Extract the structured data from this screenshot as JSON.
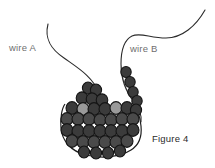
{
  "figure": {
    "caption": "Figure 4",
    "background_color": "#ffffff",
    "labels": {
      "wire_a": "wire A",
      "wire_b": "wire B"
    },
    "label_color": "#6f6f6f",
    "caption_color": "#2a2a2a",
    "line_color": "#2b2b2b",
    "bead_colors": {
      "dark": "#3b3b3b",
      "mid": "#4a4a4a",
      "light": "#9a9a9a",
      "outline": "#151515"
    },
    "wires": [
      {
        "name": "wire A",
        "path": "M 48 24 C 44 40, 52 50, 64 58 C 78 68, 92 76, 100 94 C 104 104, 104 112, 103 118"
      },
      {
        "name": "wire B",
        "path": "M 205 10 C 196 26, 182 38, 166 38 C 150 38, 140 32, 132 36 C 124 40, 121 52, 121 64 C 121 78, 126 92, 134 102 C 139 108, 142 114, 141 122"
      }
    ],
    "pouch_outline": "M 65 104 C 62 108, 60 118, 61 128 C 62 140, 70 151, 86 155 C 102 159, 120 157, 131 150 C 139 145, 142 136, 141 126 C 140 116, 137 108, 133 103",
    "bead_strand_b": [
      {
        "cx": 126,
        "cy": 72,
        "r": 5.2,
        "tone": "dark"
      },
      {
        "cx": 130,
        "cy": 82,
        "r": 5.2,
        "tone": "dark"
      },
      {
        "cx": 133,
        "cy": 92,
        "r": 5.2,
        "tone": "dark"
      },
      {
        "cx": 137,
        "cy": 101,
        "r": 5.2,
        "tone": "dark"
      }
    ],
    "bead_rows": [
      {
        "row": 1,
        "beads": [
          {
            "cx": 88,
            "cy": 88,
            "r": 5.6,
            "tone": "dark"
          },
          {
            "cx": 96,
            "cy": 90,
            "r": 5.6,
            "tone": "dark"
          }
        ]
      },
      {
        "row": 2,
        "beads": [
          {
            "cx": 82,
            "cy": 98,
            "r": 5.8,
            "tone": "dark"
          },
          {
            "cx": 92,
            "cy": 99,
            "r": 5.8,
            "tone": "dark"
          },
          {
            "cx": 102,
            "cy": 100,
            "r": 5.8,
            "tone": "dark"
          }
        ]
      },
      {
        "row": 3,
        "beads": [
          {
            "cx": 72,
            "cy": 108,
            "r": 6.0,
            "tone": "dark"
          },
          {
            "cx": 83,
            "cy": 109,
            "r": 6.0,
            "tone": "light"
          },
          {
            "cx": 94,
            "cy": 109,
            "r": 6.0,
            "tone": "dark"
          },
          {
            "cx": 105,
            "cy": 109,
            "r": 6.0,
            "tone": "dark"
          },
          {
            "cx": 116,
            "cy": 108,
            "r": 6.0,
            "tone": "light"
          },
          {
            "cx": 127,
            "cy": 108,
            "r": 6.0,
            "tone": "dark"
          },
          {
            "cx": 136,
            "cy": 110,
            "r": 5.6,
            "tone": "dark"
          }
        ]
      },
      {
        "row": 4,
        "beads": [
          {
            "cx": 67,
            "cy": 119,
            "r": 6.0,
            "tone": "mid"
          },
          {
            "cx": 78,
            "cy": 119,
            "r": 6.0,
            "tone": "mid"
          },
          {
            "cx": 89,
            "cy": 119,
            "r": 6.0,
            "tone": "mid"
          },
          {
            "cx": 100,
            "cy": 120,
            "r": 6.0,
            "tone": "mid"
          },
          {
            "cx": 111,
            "cy": 120,
            "r": 6.0,
            "tone": "mid"
          },
          {
            "cx": 122,
            "cy": 119,
            "r": 6.0,
            "tone": "mid"
          },
          {
            "cx": 133,
            "cy": 119,
            "r": 6.0,
            "tone": "mid"
          }
        ]
      },
      {
        "row": 5,
        "beads": [
          {
            "cx": 67,
            "cy": 130,
            "r": 6.0,
            "tone": "dark"
          },
          {
            "cx": 78,
            "cy": 131,
            "r": 6.0,
            "tone": "dark"
          },
          {
            "cx": 89,
            "cy": 131,
            "r": 6.0,
            "tone": "dark"
          },
          {
            "cx": 100,
            "cy": 131,
            "r": 6.0,
            "tone": "dark"
          },
          {
            "cx": 111,
            "cy": 131,
            "r": 6.0,
            "tone": "dark"
          },
          {
            "cx": 122,
            "cy": 131,
            "r": 6.0,
            "tone": "dark"
          },
          {
            "cx": 133,
            "cy": 130,
            "r": 6.0,
            "tone": "dark"
          }
        ]
      },
      {
        "row": 6,
        "beads": [
          {
            "cx": 72,
            "cy": 141,
            "r": 6.0,
            "tone": "mid"
          },
          {
            "cx": 83,
            "cy": 142,
            "r": 6.0,
            "tone": "mid"
          },
          {
            "cx": 94,
            "cy": 142,
            "r": 6.0,
            "tone": "mid"
          },
          {
            "cx": 105,
            "cy": 142,
            "r": 6.0,
            "tone": "mid"
          },
          {
            "cx": 116,
            "cy": 142,
            "r": 6.0,
            "tone": "mid"
          },
          {
            "cx": 127,
            "cy": 141,
            "r": 6.0,
            "tone": "mid"
          }
        ]
      },
      {
        "row": 7,
        "beads": [
          {
            "cx": 84,
            "cy": 152,
            "r": 5.6,
            "tone": "dark"
          },
          {
            "cx": 96,
            "cy": 153,
            "r": 5.6,
            "tone": "dark"
          },
          {
            "cx": 108,
            "cy": 153,
            "r": 5.6,
            "tone": "dark"
          },
          {
            "cx": 120,
            "cy": 151,
            "r": 5.6,
            "tone": "dark"
          }
        ]
      }
    ]
  }
}
